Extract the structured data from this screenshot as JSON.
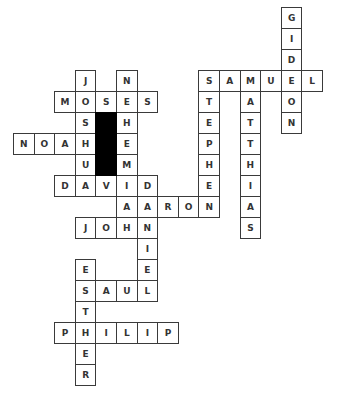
{
  "puzzle": {
    "type": "crossword",
    "grid": {
      "origin_x": 13,
      "origin_y": 7,
      "cell_w": 20.6,
      "cell_h": 21,
      "cols": 15,
      "rows": 18
    },
    "colors": {
      "border": "#3a3a3a",
      "letter": "#333333",
      "block": "#000000",
      "background": "#ffffff"
    },
    "words": [
      {
        "word": "GIDEON",
        "dir": "down",
        "row": 0,
        "col": 13
      },
      {
        "word": "SAMUEL",
        "dir": "across",
        "row": 3,
        "col": 9
      },
      {
        "word": "STEPHEN",
        "dir": "down",
        "row": 3,
        "col": 9
      },
      {
        "word": "MATTHIAS",
        "dir": "down",
        "row": 3,
        "col": 11
      },
      {
        "word": "JOSHUA",
        "dir": "down",
        "row": 3,
        "col": 3
      },
      {
        "word": "NEHEMIAH",
        "dir": "down",
        "row": 3,
        "col": 5
      },
      {
        "word": "MOSES",
        "dir": "across",
        "row": 4,
        "col": 2
      },
      {
        "word": "NOAH",
        "dir": "across",
        "row": 6,
        "col": 0
      },
      {
        "word": "DAVID",
        "dir": "across",
        "row": 8,
        "col": 2
      },
      {
        "word": "DANIEL",
        "dir": "down",
        "row": 8,
        "col": 6
      },
      {
        "word": "AARON",
        "dir": "across",
        "row": 9,
        "col": 5
      },
      {
        "word": "JOHN",
        "dir": "across",
        "row": 10,
        "col": 3
      },
      {
        "word": "ESTHER",
        "dir": "down",
        "row": 12,
        "col": 3
      },
      {
        "word": "SAUL",
        "dir": "across",
        "row": 13,
        "col": 3
      },
      {
        "word": "PHILIP",
        "dir": "across",
        "row": 15,
        "col": 2
      }
    ],
    "blocks": [
      {
        "row": 5,
        "col": 4
      },
      {
        "row": 6,
        "col": 4
      },
      {
        "row": 7,
        "col": 4
      }
    ]
  }
}
